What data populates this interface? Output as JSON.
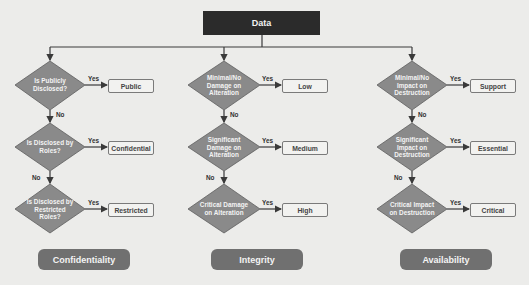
{
  "diagram": {
    "root": {
      "label": "Data"
    },
    "columns": [
      {
        "category": "Confidentiality",
        "decisions": [
          {
            "question": "Is Publicly Disclosed?",
            "yes_label": "Yes",
            "result": "Public",
            "no_label": "No"
          },
          {
            "question": "Is Disclosed by Roles?",
            "yes_label": "Yes",
            "result": "Confidential",
            "no_label": "No"
          },
          {
            "question": "Is Disclosed by Restricted Roles?",
            "yes_label": "Yes",
            "result": "Restricted"
          }
        ]
      },
      {
        "category": "Integrity",
        "decisions": [
          {
            "question": "Minimal/No Damage on Alteration",
            "yes_label": "Yes",
            "result": "Low",
            "no_label": "No"
          },
          {
            "question": "Significant Damage on Alteration",
            "yes_label": "Yes",
            "result": "Medium",
            "no_label": "No"
          },
          {
            "question": "Critical Damage on Alteration",
            "yes_label": "Yes",
            "result": "High"
          }
        ]
      },
      {
        "category": "Availability",
        "decisions": [
          {
            "question": "Minimal/No Impact on Destruction",
            "yes_label": "Yes",
            "result": "Support",
            "no_label": "No"
          },
          {
            "question": "Significant Impact on Destruction",
            "yes_label": "Yes",
            "result": "Essential",
            "no_label": "No"
          },
          {
            "question": "Critical Impact on Destruction",
            "yes_label": "Yes",
            "result": "Critical"
          }
        ]
      }
    ]
  },
  "colors": {
    "root_fill": "#2b2b2b",
    "diamond_fill": "#8a8a8a",
    "pill_fill": "#707070",
    "line": "#3a3a3a",
    "background": "#ececea"
  }
}
